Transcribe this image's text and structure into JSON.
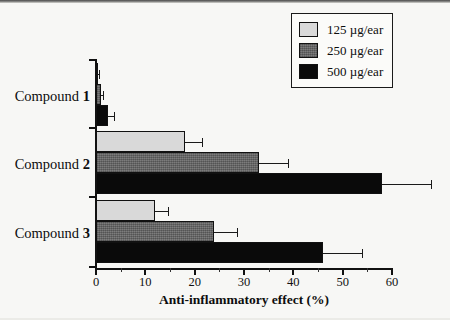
{
  "chart_data": {
    "type": "bar",
    "orientation": "horizontal",
    "title": "",
    "xlabel": "Anti-inflammatory effect (%)",
    "ylabel": "",
    "xlim": [
      0,
      60
    ],
    "xticks": [
      0,
      10,
      20,
      30,
      40,
      50,
      60
    ],
    "xtick_labels": [
      "0",
      "10",
      "20",
      "30",
      "40",
      "50",
      "60"
    ],
    "xminor_ticks": [
      5,
      15,
      25,
      35,
      45,
      55
    ],
    "grid": false,
    "legend_position": "top-right",
    "categories": [
      "Compound 1",
      "Compound 2",
      "Compound 3"
    ],
    "series": [
      {
        "name": "125 µg/ear",
        "color": "#d9d9d9",
        "values": [
          0.3,
          18.0,
          12.0
        ],
        "errors": [
          0.3,
          3.5,
          2.5
        ]
      },
      {
        "name": "250 µg/ear",
        "color": "#6b6b6b",
        "values": [
          1.0,
          33.0,
          24.0
        ],
        "errors": [
          0.5,
          6.0,
          4.5
        ]
      },
      {
        "name": "500 µg/ear",
        "color": "#0a0a0a",
        "values": [
          2.5,
          58.0,
          46.0
        ],
        "errors": [
          1.2,
          10.0,
          8.0
        ]
      }
    ]
  },
  "axis": {
    "x_title": "Anti-inflammatory effect (%)",
    "tick_labels": [
      "0",
      "10",
      "20",
      "30",
      "40",
      "50",
      "60"
    ]
  },
  "categories": [
    {
      "prefix": "Compound ",
      "number": "1"
    },
    {
      "prefix": "Compound ",
      "number": "2"
    },
    {
      "prefix": "Compound ",
      "number": "3"
    }
  ],
  "legend": {
    "items": [
      {
        "label": "125 µg/ear",
        "style": "s125"
      },
      {
        "label": "250 µg/ear",
        "style": "s250"
      },
      {
        "label": "500 µg/ear",
        "style": "s500"
      }
    ]
  }
}
